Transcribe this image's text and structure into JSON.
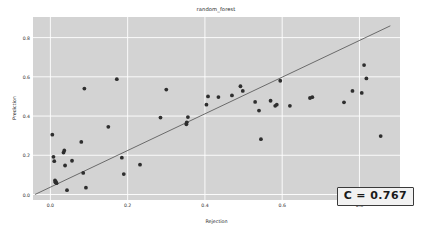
{
  "figure": {
    "title": "random_forest",
    "annotation": "C = 0.767",
    "background_color": "#ffffff",
    "axes_background_color": "#d3d3d3",
    "grid_color": "#ffffff",
    "point_color": "#2e2e2e",
    "line_color": "#4f4f4f"
  },
  "axis": {
    "xlabel": "Rejection",
    "ylabel": "Prediction",
    "xticks": [
      "0.0",
      "0.2",
      "0.4",
      "0.6",
      "0.8"
    ],
    "yticks": [
      "0.0",
      "0.2",
      "0.4",
      "0.6",
      "0.8"
    ]
  },
  "chart_data": {
    "type": "scatter",
    "title": "random_forest",
    "xlabel": "Rejection",
    "ylabel": "Prediction",
    "xlim": [
      -0.045,
      0.905
    ],
    "ylim": [
      -0.028,
      0.905
    ],
    "xticks": [
      0.0,
      0.2,
      0.4,
      0.6,
      0.8
    ],
    "yticks": [
      0.0,
      0.2,
      0.4,
      0.6,
      0.8
    ],
    "grid": true,
    "legend": false,
    "annotations": [
      {
        "text": "C = 0.767",
        "position": "lower-right",
        "value": 0.767,
        "label": "C"
      }
    ],
    "reference_line": {
      "type": "line",
      "description": "diagonal fit line from lower-left to upper-right",
      "x": [
        -0.04,
        0.88
      ],
      "y": [
        0.0,
        0.86
      ]
    },
    "points": [
      {
        "x": 0.005,
        "y": 0.305
      },
      {
        "x": 0.008,
        "y": 0.192
      },
      {
        "x": 0.01,
        "y": 0.17
      },
      {
        "x": 0.012,
        "y": 0.072
      },
      {
        "x": 0.013,
        "y": 0.062
      },
      {
        "x": 0.014,
        "y": 0.066
      },
      {
        "x": 0.016,
        "y": 0.058
      },
      {
        "x": 0.034,
        "y": 0.214
      },
      {
        "x": 0.036,
        "y": 0.225
      },
      {
        "x": 0.038,
        "y": 0.148
      },
      {
        "x": 0.043,
        "y": 0.022
      },
      {
        "x": 0.056,
        "y": 0.172
      },
      {
        "x": 0.08,
        "y": 0.268
      },
      {
        "x": 0.085,
        "y": 0.11
      },
      {
        "x": 0.088,
        "y": 0.54
      },
      {
        "x": 0.092,
        "y": 0.035
      },
      {
        "x": 0.15,
        "y": 0.345
      },
      {
        "x": 0.172,
        "y": 0.588
      },
      {
        "x": 0.185,
        "y": 0.188
      },
      {
        "x": 0.19,
        "y": 0.104
      },
      {
        "x": 0.232,
        "y": 0.152
      },
      {
        "x": 0.285,
        "y": 0.392
      },
      {
        "x": 0.3,
        "y": 0.535
      },
      {
        "x": 0.352,
        "y": 0.358
      },
      {
        "x": 0.353,
        "y": 0.368
      },
      {
        "x": 0.356,
        "y": 0.395
      },
      {
        "x": 0.404,
        "y": 0.458
      },
      {
        "x": 0.408,
        "y": 0.5
      },
      {
        "x": 0.435,
        "y": 0.497
      },
      {
        "x": 0.47,
        "y": 0.505
      },
      {
        "x": 0.492,
        "y": 0.552
      },
      {
        "x": 0.498,
        "y": 0.528
      },
      {
        "x": 0.53,
        "y": 0.472
      },
      {
        "x": 0.54,
        "y": 0.428
      },
      {
        "x": 0.545,
        "y": 0.282
      },
      {
        "x": 0.57,
        "y": 0.478
      },
      {
        "x": 0.582,
        "y": 0.452
      },
      {
        "x": 0.586,
        "y": 0.458
      },
      {
        "x": 0.595,
        "y": 0.58
      },
      {
        "x": 0.62,
        "y": 0.452
      },
      {
        "x": 0.672,
        "y": 0.492
      },
      {
        "x": 0.678,
        "y": 0.496
      },
      {
        "x": 0.76,
        "y": 0.47
      },
      {
        "x": 0.782,
        "y": 0.528
      },
      {
        "x": 0.806,
        "y": 0.518
      },
      {
        "x": 0.812,
        "y": 0.66
      },
      {
        "x": 0.818,
        "y": 0.592
      },
      {
        "x": 0.855,
        "y": 0.298
      }
    ]
  }
}
